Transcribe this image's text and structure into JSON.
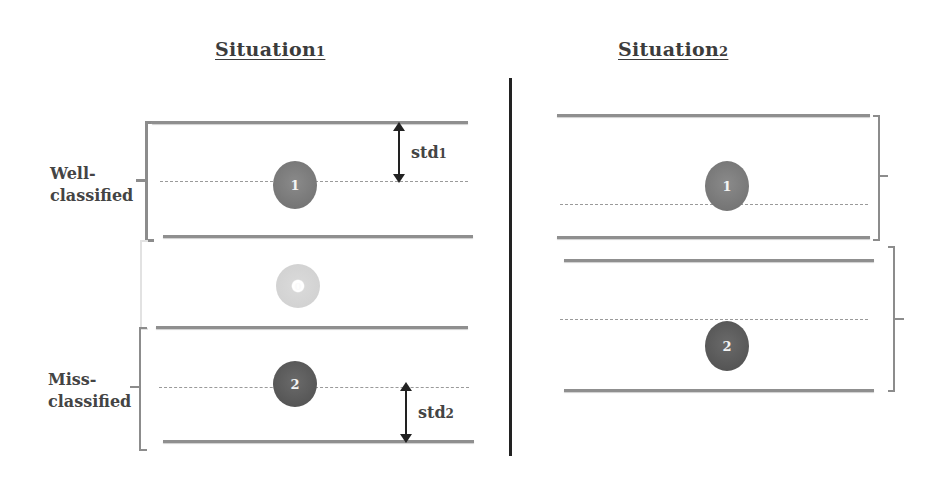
{
  "situation1": {
    "title": "Situation",
    "title_sub": "1",
    "labels": {
      "well_classified": [
        "Well-",
        "classified"
      ],
      "miss_classified": [
        "Miss-",
        "classified"
      ]
    },
    "std1": {
      "text": "std",
      "sub": "1"
    },
    "std2": {
      "text": "std",
      "sub": "2"
    },
    "clusters": [
      {
        "id": "1",
        "label": "1",
        "color": "#7a7a7a"
      },
      {
        "id": "0",
        "label": "0",
        "color": "#d6d6d6"
      },
      {
        "id": "2",
        "label": "2",
        "color": "#5a5a5a"
      }
    ]
  },
  "situation2": {
    "title": "Situation",
    "title_sub": "2",
    "clusters": [
      {
        "id": "1",
        "label": "1",
        "color": "#7a7a7a"
      },
      {
        "id": "2",
        "label": "2",
        "color": "#5a5a5a"
      }
    ]
  },
  "colors": {
    "line": "#8f8f8f",
    "divider": "#222222",
    "arrow": "#222222"
  }
}
